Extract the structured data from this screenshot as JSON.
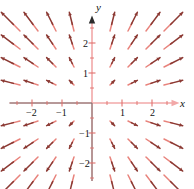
{
  "figure": {
    "background_color": "#ffffff",
    "arrow_color": "#8c3a34",
    "arrow_tail_color": "#e8837c",
    "axis_color": "#f2a8a8",
    "axis_dark_color": "#6b6b6b",
    "tick_color": "#e0706c"
  },
  "chart_data": {
    "type": "scatter",
    "subtype": "vector-field",
    "title": "",
    "xlabel": "x",
    "ylabel": "y",
    "xlim": [
      -2.75,
      2.75
    ],
    "ylim": [
      -2.6,
      2.75
    ],
    "grid": false,
    "legend": null,
    "field_definition": {
      "u_expression": "x",
      "v_expression": "y",
      "description": "radial outward vector field, arrows point away from the origin"
    },
    "sample_grid": {
      "x_values": [
        -2.4,
        -1.8,
        -1.2,
        -0.6,
        0.6,
        1.2,
        1.8,
        2.4
      ],
      "y_values": [
        -2.4,
        -1.8,
        -1.2,
        -0.6,
        0.6,
        1.2,
        1.8,
        2.4
      ]
    },
    "arrow_scale": 0.26,
    "xticks": [
      -2,
      -1,
      1,
      2
    ],
    "xtick_labels": [
      "-2",
      "-1",
      "1",
      "2"
    ],
    "yticks": [
      -2,
      -1,
      1,
      2
    ],
    "ytick_labels": [
      "-2",
      "-1",
      "1",
      "2"
    ],
    "minor_tick_step": 0.5,
    "axis_arrowheads": [
      "x-positive",
      "y-positive"
    ]
  },
  "labels": {
    "x_axis": "x",
    "y_axis": "y",
    "x_neg2": "−2",
    "x_neg1": "−1",
    "x_pos1": "1",
    "x_pos2": "2",
    "y_neg2": "−2",
    "y_neg1": "−1",
    "y_pos1": "1",
    "y_pos2": "2"
  }
}
